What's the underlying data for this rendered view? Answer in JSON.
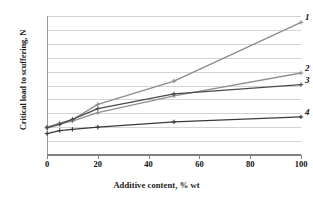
{
  "chart_data": {
    "type": "line",
    "title": "",
    "xlabel": "Additive content,  % wt",
    "ylabel": "Critical load to scuffering, N",
    "xlim": [
      0,
      100
    ],
    "ylim": [
      0,
      500
    ],
    "xticks": [
      0,
      20,
      40,
      60,
      80,
      100
    ],
    "yticks": [
      0,
      50,
      100,
      150,
      200,
      250,
      300,
      350,
      400,
      450,
      500
    ],
    "grid": "horizontal",
    "legend_position": "line-end-labels",
    "x": [
      0,
      5,
      10,
      20,
      50,
      100
    ],
    "series": [
      {
        "name": "1",
        "label": "1",
        "color": "#8c8c8c",
        "marker": "plus",
        "values": [
          100,
          115,
          127,
          182,
          266,
          477
        ]
      },
      {
        "name": "2",
        "label": "2",
        "color": "#8f8f8f",
        "marker": "plus",
        "values": [
          100,
          112,
          122,
          152,
          213,
          295
        ]
      },
      {
        "name": "3",
        "label": "3",
        "color": "#4a4a4a",
        "marker": "plus",
        "values": [
          98,
          110,
          128,
          167,
          220,
          253
        ]
      },
      {
        "name": "4",
        "label": "4",
        "color": "#3a3a3a",
        "marker": "plus",
        "values": [
          77,
          88,
          92,
          100,
          119,
          137
        ]
      }
    ]
  }
}
